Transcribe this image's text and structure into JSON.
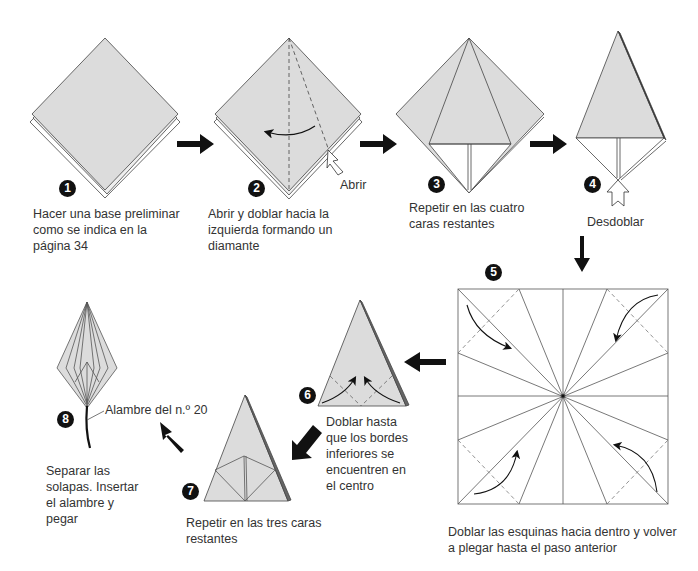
{
  "colors": {
    "paper_fill": "#dcdcdc",
    "line": "#333333",
    "arrow": "#111111",
    "background": "#ffffff"
  },
  "steps": [
    {
      "number": "1",
      "caption": "Hacer una base preliminar\ncomo se indica en la\npágina 34"
    },
    {
      "number": "2",
      "caption": "Abrir y doblar hacia la\nizquierda formando un\ndiamante",
      "label": "Abrir"
    },
    {
      "number": "3",
      "caption": "Repetir en las cuatro\ncaras restantes"
    },
    {
      "number": "4",
      "caption": "Desdoblar"
    },
    {
      "number": "5",
      "caption": "Doblar las esquinas hacia dentro y volver\na plegar hasta el paso anterior"
    },
    {
      "number": "6",
      "caption": "Doblar hasta\nque los bordes\ninferiores se\nencuentren en\n el centro"
    },
    {
      "number": "7",
      "caption": "Repetir en las tres caras\nrestantes"
    },
    {
      "number": "8",
      "caption": "Separar las\nsolapas. Insertar\nel alambre y\npegar",
      "label": "Alambre del n.º 20"
    }
  ],
  "flow_arrows": [
    "right",
    "right",
    "right",
    "down",
    "left",
    "down-left",
    "up-left"
  ]
}
